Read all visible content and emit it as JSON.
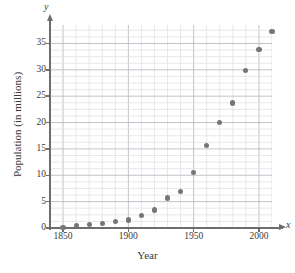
{
  "chart_data": {
    "type": "scatter",
    "title": "",
    "xlabel": "Year",
    "ylabel": "Population (in millions)",
    "x_variable_symbol": "x",
    "y_variable_symbol": "y",
    "xlim": [
      1840,
      2010
    ],
    "ylim": [
      0,
      38.5
    ],
    "x_major_ticks": [
      1850,
      1900,
      1950,
      2000
    ],
    "x_major_tick_labels": [
      "1850",
      "1900",
      "1950",
      "2000"
    ],
    "x_minor_tick_step": 10,
    "y_major_ticks": [
      0,
      5,
      10,
      15,
      20,
      25,
      30,
      35
    ],
    "y_major_tick_labels": [
      "0",
      "5",
      "10",
      "15",
      "20",
      "25",
      "30",
      "35"
    ],
    "y_minor_tick_step": 1.25,
    "grid": true,
    "grid_style": "major and minor rectangular grid",
    "legend": "none",
    "marker": "filled circle",
    "marker_color": "#767676",
    "axis_color": "#6d6d6d",
    "grid_color_major": "#b9bcc4",
    "grid_color_minor": "#dcdee3",
    "background_color": "#ffffff",
    "x": [
      1850,
      1860,
      1870,
      1880,
      1890,
      1900,
      1910,
      1920,
      1930,
      1940,
      1950,
      1960,
      1970,
      1980,
      1990,
      2000,
      2010
    ],
    "values": [
      0.1,
      0.4,
      0.6,
      0.9,
      1.2,
      1.5,
      2.4,
      3.4,
      5.7,
      6.9,
      10.6,
      15.7,
      20.0,
      23.7,
      29.8,
      33.9,
      37.3
    ],
    "points": [
      {
        "year": 1850,
        "population": 0.1
      },
      {
        "year": 1860,
        "population": 0.4
      },
      {
        "year": 1870,
        "population": 0.6
      },
      {
        "year": 1880,
        "population": 0.9
      },
      {
        "year": 1890,
        "population": 1.2
      },
      {
        "year": 1900,
        "population": 1.5
      },
      {
        "year": 1910,
        "population": 2.4
      },
      {
        "year": 1920,
        "population": 3.4
      },
      {
        "year": 1930,
        "population": 5.7
      },
      {
        "year": 1940,
        "population": 6.9
      },
      {
        "year": 1950,
        "population": 10.6
      },
      {
        "year": 1960,
        "population": 15.7
      },
      {
        "year": 1970,
        "population": 20.0
      },
      {
        "year": 1980,
        "population": 23.7
      },
      {
        "year": 1990,
        "population": 29.8
      },
      {
        "year": 2000,
        "population": 33.9
      },
      {
        "year": 2010,
        "population": 37.3
      }
    ]
  }
}
